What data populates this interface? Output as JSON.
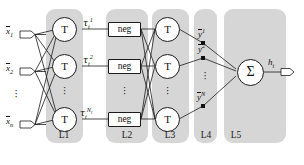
{
  "figure": {
    "type": "neural-network-diagram",
    "background_color": "#ffffff",
    "panel_color": "#d6d6d6",
    "stroke_color": "#1c1c1c"
  },
  "layers": [
    {
      "id": "L1",
      "label": "L1",
      "node_count": 3,
      "node_shape": "circle",
      "node_text": "T"
    },
    {
      "id": "L2",
      "label": "L2",
      "node_count": 3,
      "node_shape": "rectangle",
      "node_text": "neg"
    },
    {
      "id": "L3",
      "label": "L3",
      "node_count": 3,
      "node_shape": "circle",
      "node_text": "T"
    },
    {
      "id": "L4",
      "label": "L4",
      "node_count": 3,
      "node_shape": "junction",
      "node_text": ""
    },
    {
      "id": "L5",
      "label": "L5",
      "node_count": 1,
      "node_shape": "circle",
      "node_text": "Σ"
    }
  ],
  "inputs": [
    {
      "name": "input-1",
      "base": "x",
      "sub": "1",
      "overbar": true
    },
    {
      "name": "input-2",
      "base": "x",
      "sub": "2",
      "overbar": true
    },
    {
      "name": "input-n",
      "base": "x",
      "sub": "n",
      "overbar": true
    }
  ],
  "input_ellipsis": "⋮",
  "l1_nodes": [
    {
      "text": "T"
    },
    {
      "text": "T"
    },
    {
      "text": "T"
    }
  ],
  "l1_outputs": [
    {
      "name": "tau-1",
      "base": "τ",
      "sub": "t",
      "sup": "1"
    },
    {
      "name": "tau-2",
      "base": "τ",
      "sub": "t",
      "sup": "2"
    },
    {
      "name": "tau-Nl",
      "base": "τ",
      "sub": "t",
      "sup": "N",
      "sup_sub": "l"
    }
  ],
  "l2_nodes": [
    {
      "text": "neg"
    },
    {
      "text": "neg"
    },
    {
      "text": "neg"
    }
  ],
  "l3_nodes": [
    {
      "text": "T"
    },
    {
      "text": "T"
    },
    {
      "text": "T"
    }
  ],
  "l4_outputs": [
    {
      "name": "y-1",
      "base": "y",
      "sup": "1",
      "overbar": true
    },
    {
      "name": "y-2",
      "base": "y",
      "sup": "2",
      "overbar": true
    },
    {
      "name": "y-N",
      "base": "y",
      "sup": "N",
      "overbar": true
    }
  ],
  "l5_node": {
    "text": "Σ"
  },
  "output": {
    "name": "output-ht",
    "base": "h",
    "sub": "t"
  },
  "ellipsis_glyph": "·",
  "panel_labels": {
    "l1": "L1",
    "l2": "L2",
    "l3": "L3",
    "l4": "L4",
    "l5": "L5"
  }
}
